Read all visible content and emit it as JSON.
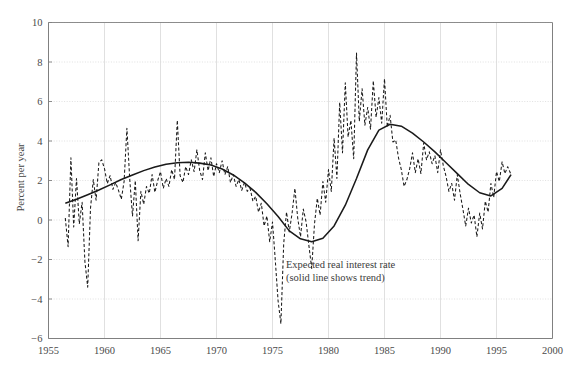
{
  "chart_data": {
    "type": "line",
    "title": "",
    "xlabel": "",
    "ylabel": "Percent per year",
    "xlim": [
      1955,
      2000
    ],
    "ylim": [
      -6,
      10
    ],
    "xticks": [
      1955,
      1960,
      1965,
      1970,
      1975,
      1980,
      1985,
      1990,
      1995,
      2000
    ],
    "yticks": [
      -6,
      -4,
      -2,
      0,
      2,
      4,
      6,
      8,
      10
    ],
    "grid": true,
    "legend_position": "none",
    "annotations": [
      {
        "name": "series-annotation",
        "line1": "Expected real interest rate",
        "line2": "(solid line shows trend)",
        "x": 1976.2,
        "y": -2.45
      }
    ],
    "colors": {
      "data_line": "#1a1a1a",
      "trend_line": "#1a1a1a",
      "grid": "#d8d8d8",
      "axis": "#808080",
      "text": "#4a4a4a"
    },
    "series": [
      {
        "name": "Expected real interest rate",
        "style": "dashed",
        "x": [
          1956.5,
          1956.75,
          1957.0,
          1957.25,
          1957.5,
          1957.75,
          1958.0,
          1958.25,
          1958.5,
          1958.75,
          1959.0,
          1959.25,
          1959.5,
          1959.75,
          1960.0,
          1960.25,
          1960.5,
          1960.75,
          1961.0,
          1961.25,
          1961.5,
          1961.75,
          1962.0,
          1962.25,
          1962.5,
          1962.75,
          1963.0,
          1963.25,
          1963.5,
          1963.75,
          1964.0,
          1964.25,
          1964.5,
          1964.75,
          1965.0,
          1965.25,
          1965.5,
          1965.75,
          1966.0,
          1966.25,
          1966.5,
          1966.75,
          1967.0,
          1967.25,
          1967.5,
          1967.75,
          1968.0,
          1968.25,
          1968.5,
          1968.75,
          1969.0,
          1969.25,
          1969.5,
          1969.75,
          1970.0,
          1970.25,
          1970.5,
          1970.75,
          1971.0,
          1971.25,
          1971.5,
          1971.75,
          1972.0,
          1972.25,
          1972.5,
          1972.75,
          1973.0,
          1973.25,
          1973.5,
          1973.75,
          1974.0,
          1974.25,
          1974.5,
          1974.75,
          1975.0,
          1975.25,
          1975.5,
          1975.75,
          1976.0,
          1976.25,
          1976.5,
          1976.75,
          1977.0,
          1977.25,
          1977.5,
          1977.75,
          1978.0,
          1978.25,
          1978.5,
          1978.75,
          1979.0,
          1979.25,
          1979.5,
          1979.75,
          1980.0,
          1980.25,
          1980.5,
          1980.75,
          1981.0,
          1981.25,
          1981.5,
          1981.75,
          1982.0,
          1982.25,
          1982.5,
          1982.75,
          1983.0,
          1983.25,
          1983.5,
          1983.75,
          1984.0,
          1984.25,
          1984.5,
          1984.75,
          1985.0,
          1985.25,
          1985.5,
          1985.75,
          1986.0,
          1986.25,
          1986.5,
          1986.75,
          1987.0,
          1987.25,
          1987.5,
          1987.75,
          1988.0,
          1988.25,
          1988.5,
          1988.75,
          1989.0,
          1989.25,
          1989.5,
          1989.75,
          1990.0,
          1990.25,
          1990.5,
          1990.75,
          1991.0,
          1991.25,
          1991.5,
          1991.75,
          1992.0,
          1992.25,
          1992.5,
          1992.75,
          1993.0,
          1993.25,
          1993.5,
          1993.75,
          1994.0,
          1994.25,
          1994.5,
          1994.75,
          1995.0,
          1995.25,
          1995.5,
          1995.75,
          1996.0,
          1996.3
        ],
        "y": [
          0.1,
          -1.35,
          3.15,
          -0.35,
          2.1,
          -0.2,
          0.9,
          -2.1,
          -3.4,
          0.6,
          2.05,
          1.0,
          2.9,
          3.05,
          2.6,
          1.85,
          2.25,
          1.55,
          1.9,
          1.5,
          1.05,
          1.95,
          4.65,
          2.1,
          0.2,
          2.0,
          -1.05,
          1.45,
          0.8,
          1.7,
          1.35,
          2.3,
          1.4,
          2.0,
          2.45,
          1.6,
          2.1,
          1.7,
          2.55,
          2.05,
          5.05,
          2.25,
          1.9,
          2.7,
          2.3,
          3.05,
          2.45,
          3.55,
          2.5,
          2.05,
          3.4,
          2.5,
          3.15,
          2.2,
          2.85,
          2.4,
          3.0,
          2.3,
          2.7,
          1.9,
          2.3,
          1.7,
          2.05,
          1.5,
          1.9,
          1.45,
          1.6,
          0.95,
          1.2,
          0.4,
          0.85,
          -0.3,
          0.2,
          -1.1,
          -0.1,
          -2.05,
          -4.1,
          -5.25,
          -1.2,
          0.4,
          -0.6,
          0.35,
          1.6,
          0.1,
          -0.85,
          0.55,
          -0.1,
          -1.3,
          -2.45,
          -0.2,
          1.1,
          0.25,
          1.95,
          0.9,
          2.55,
          1.45,
          4.15,
          2.1,
          5.95,
          3.4,
          6.95,
          4.2,
          5.05,
          3.1,
          8.45,
          5.0,
          6.65,
          4.8,
          5.7,
          4.6,
          7.05,
          5.2,
          6.2,
          4.9,
          7.15,
          4.7,
          5.3,
          3.95,
          4.05,
          3.15,
          2.55,
          1.7,
          2.05,
          2.6,
          3.4,
          2.4,
          3.1,
          2.35,
          3.9,
          3.05,
          3.45,
          2.85,
          3.25,
          2.4,
          3.55,
          2.75,
          2.2,
          1.45,
          1.85,
          1.0,
          2.3,
          1.35,
          0.55,
          -0.3,
          0.6,
          -0.15,
          0.25,
          -0.85,
          0.35,
          -0.45,
          0.95,
          0.4,
          1.85,
          1.15,
          2.45,
          1.95,
          2.95,
          2.35,
          2.7,
          2.3
        ]
      },
      {
        "name": "Trend (solid line)",
        "style": "solid",
        "x": [
          1956.5,
          1957.5,
          1958.5,
          1959.5,
          1960.5,
          1961.5,
          1962.5,
          1963.5,
          1964.5,
          1965.5,
          1966.5,
          1967.5,
          1968.5,
          1969.5,
          1970.5,
          1971.5,
          1972.5,
          1973.5,
          1974.5,
          1975.5,
          1976.5,
          1977.5,
          1978.5,
          1979.5,
          1980.5,
          1981.5,
          1982.5,
          1983.5,
          1984.5,
          1985.5,
          1986.5,
          1987.5,
          1988.5,
          1989.5,
          1990.5,
          1991.5,
          1992.5,
          1993.5,
          1994.5,
          1995.5,
          1996.3
        ],
        "y": [
          0.85,
          1.05,
          1.28,
          1.52,
          1.78,
          2.05,
          2.28,
          2.5,
          2.68,
          2.82,
          2.9,
          2.92,
          2.88,
          2.78,
          2.58,
          2.28,
          1.88,
          1.4,
          0.82,
          0.18,
          -0.55,
          -0.95,
          -1.1,
          -0.92,
          -0.3,
          0.75,
          2.1,
          3.55,
          4.55,
          4.85,
          4.75,
          4.4,
          3.95,
          3.45,
          2.9,
          2.35,
          1.8,
          1.38,
          1.22,
          1.6,
          2.3
        ]
      }
    ]
  }
}
